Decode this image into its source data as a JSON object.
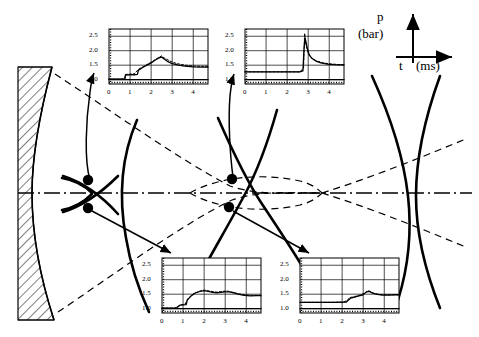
{
  "figure": {
    "name": "shock-wave-focusing-diagram",
    "axis_legend": {
      "pressure_symbol": "p",
      "pressure_unit": "(bar)",
      "time_symbol": "t",
      "time_unit": "(ms)"
    },
    "reflector": {
      "name": "hatched-parabolic-reflector"
    },
    "measurement_points": [
      {
        "id": "P1",
        "x": 88,
        "y": 180
      },
      {
        "id": "P2",
        "x": 88,
        "y": 208
      },
      {
        "id": "P3",
        "x": 232,
        "y": 179
      },
      {
        "id": "P4",
        "x": 229,
        "y": 207
      }
    ]
  },
  "colors": {
    "ink": "#000000",
    "grid": "#000000",
    "background": "#ffffff"
  },
  "chart_data": [
    {
      "id": "chart-top-left",
      "type": "line",
      "title": "",
      "xlabel": "t (ms)",
      "ylabel": "p (bar)",
      "xlim": [
        0,
        4.7
      ],
      "ylim": [
        0.85,
        2.75
      ],
      "xticks": [
        0,
        1,
        2,
        3,
        4
      ],
      "xticklabels": [
        "0",
        "1",
        "2",
        "3",
        "4"
      ],
      "yticks": [
        1.0,
        1.5,
        2.0,
        2.5
      ],
      "yticklabels": [
        "1.0",
        "1.5",
        "2.0",
        "2.5"
      ],
      "grid": true,
      "legend": "none",
      "series": [
        {
          "name": "measured",
          "x": [
            0,
            0.3,
            0.6,
            0.75,
            0.78,
            1.0,
            1.2,
            1.35,
            1.4,
            1.6,
            1.8,
            2.0,
            2.2,
            2.4,
            2.5,
            2.6,
            2.8,
            3.0,
            3.3,
            3.6,
            4.0,
            4.4,
            4.7
          ],
          "values": [
            1.02,
            1.02,
            1.02,
            1.03,
            1.16,
            1.17,
            1.17,
            1.18,
            1.33,
            1.42,
            1.5,
            1.58,
            1.68,
            1.76,
            1.78,
            1.72,
            1.62,
            1.55,
            1.5,
            1.47,
            1.44,
            1.43,
            1.43
          ]
        },
        {
          "name": "computed",
          "x": [
            0,
            0.5,
            0.75,
            0.78,
            1.2,
            1.4,
            1.7,
            2.0,
            2.3,
            2.5,
            2.6,
            2.9,
            3.2,
            3.6,
            4.0,
            4.4,
            4.7
          ],
          "values": [
            1.02,
            1.02,
            1.03,
            1.18,
            1.2,
            1.36,
            1.48,
            1.6,
            1.74,
            1.82,
            1.76,
            1.64,
            1.56,
            1.5,
            1.47,
            1.46,
            1.46
          ]
        },
        {
          "name": "baseline",
          "x": [
            0,
            4.7
          ],
          "values": [
            1.0,
            1.0
          ]
        }
      ]
    },
    {
      "id": "chart-top-right",
      "type": "line",
      "title": "",
      "xlabel": "t (ms)",
      "ylabel": "p (bar)",
      "xlim": [
        0,
        4.7
      ],
      "ylim": [
        0.85,
        2.75
      ],
      "xticks": [
        0,
        1,
        2,
        3,
        4
      ],
      "xticklabels": [
        "0",
        "1",
        "2",
        "3",
        "4"
      ],
      "yticks": [
        1.0,
        1.5,
        2.0,
        2.5
      ],
      "yticklabels": [
        "1.0",
        "1.5",
        "2.0",
        "2.5"
      ],
      "grid": true,
      "legend": "none",
      "series": [
        {
          "name": "measured",
          "x": [
            0,
            1.0,
            2.0,
            2.6,
            2.75,
            2.8,
            2.85,
            2.95,
            3.05,
            3.2,
            3.4,
            3.6,
            3.9,
            4.2,
            4.5,
            4.7
          ],
          "values": [
            1.27,
            1.27,
            1.27,
            1.27,
            1.3,
            2.05,
            2.45,
            2.1,
            1.85,
            1.72,
            1.63,
            1.58,
            1.54,
            1.52,
            1.51,
            1.51
          ]
        },
        {
          "name": "computed",
          "x": [
            0,
            1.5,
            2.6,
            2.78,
            2.83,
            2.9,
            3.0,
            3.15,
            3.35,
            3.7,
            4.1,
            4.5,
            4.7
          ],
          "values": [
            1.27,
            1.27,
            1.27,
            1.4,
            2.6,
            2.2,
            1.92,
            1.76,
            1.66,
            1.58,
            1.54,
            1.52,
            1.52
          ]
        },
        {
          "name": "baseline",
          "x": [
            0,
            4.7
          ],
          "values": [
            1.0,
            1.0
          ]
        }
      ]
    },
    {
      "id": "chart-bottom-left",
      "type": "line",
      "title": "",
      "xlabel": "t (ms)",
      "ylabel": "p (bar)",
      "xlim": [
        0,
        4.7
      ],
      "ylim": [
        0.85,
        2.75
      ],
      "xticks": [
        0,
        1,
        2,
        3,
        4
      ],
      "xticklabels": [
        "0",
        "1",
        "2",
        "3",
        "4"
      ],
      "yticks": [
        1.0,
        1.5,
        2.0,
        2.5
      ],
      "yticklabels": [
        "1.0",
        "1.5",
        "2.0",
        "2.5"
      ],
      "grid": true,
      "legend": "none",
      "series": [
        {
          "name": "measured",
          "x": [
            0,
            0.4,
            0.7,
            0.85,
            1.0,
            1.15,
            1.2,
            1.4,
            1.6,
            1.8,
            2.0,
            2.2,
            2.4,
            2.6,
            2.8,
            3.0,
            3.2,
            3.4,
            3.6,
            3.9,
            4.2,
            4.5,
            4.7
          ],
          "values": [
            1.02,
            1.02,
            1.03,
            1.12,
            1.13,
            1.14,
            1.3,
            1.45,
            1.55,
            1.6,
            1.62,
            1.6,
            1.56,
            1.55,
            1.56,
            1.58,
            1.58,
            1.55,
            1.5,
            1.46,
            1.44,
            1.45,
            1.45
          ]
        },
        {
          "name": "computed",
          "x": [
            0,
            0.6,
            0.9,
            1.1,
            1.25,
            1.5,
            1.8,
            2.0,
            2.3,
            2.6,
            2.9,
            3.1,
            3.3,
            3.6,
            4.0,
            4.4,
            4.7
          ],
          "values": [
            1.02,
            1.02,
            1.13,
            1.16,
            1.36,
            1.52,
            1.6,
            1.64,
            1.6,
            1.57,
            1.6,
            1.61,
            1.57,
            1.52,
            1.47,
            1.46,
            1.46
          ]
        },
        {
          "name": "baseline",
          "x": [
            0,
            4.7
          ],
          "values": [
            1.0,
            1.0
          ]
        }
      ]
    },
    {
      "id": "chart-bottom-right",
      "type": "line",
      "title": "",
      "xlabel": "t (ms)",
      "ylabel": "p (bar)",
      "xlim": [
        0,
        4.7
      ],
      "ylim": [
        0.85,
        2.75
      ],
      "xticks": [
        0,
        1,
        2,
        3,
        4
      ],
      "xticklabels": [
        "0",
        "1",
        "2",
        "3",
        "4"
      ],
      "yticks": [
        1.0,
        1.5,
        2.0,
        2.5
      ],
      "yticklabels": [
        "1.0",
        "1.5",
        "2.0",
        "2.5"
      ],
      "grid": true,
      "legend": "none",
      "series": [
        {
          "name": "measured",
          "x": [
            0,
            0.8,
            1.6,
            2.2,
            2.3,
            2.4,
            2.6,
            2.8,
            3.0,
            3.15,
            3.3,
            3.4,
            3.6,
            3.9,
            4.2,
            4.5,
            4.7
          ],
          "values": [
            1.22,
            1.22,
            1.22,
            1.23,
            1.3,
            1.36,
            1.4,
            1.44,
            1.48,
            1.58,
            1.6,
            1.55,
            1.5,
            1.47,
            1.47,
            1.48,
            1.48
          ]
        },
        {
          "name": "computed",
          "x": [
            0,
            1.0,
            2.0,
            2.25,
            2.35,
            2.6,
            2.9,
            3.1,
            3.25,
            3.45,
            3.7,
            4.1,
            4.5,
            4.7
          ],
          "values": [
            1.22,
            1.22,
            1.22,
            1.28,
            1.38,
            1.42,
            1.48,
            1.55,
            1.62,
            1.54,
            1.5,
            1.48,
            1.48,
            1.48
          ]
        },
        {
          "name": "baseline",
          "x": [
            0,
            4.7
          ],
          "values": [
            1.0,
            1.0
          ]
        }
      ]
    }
  ]
}
